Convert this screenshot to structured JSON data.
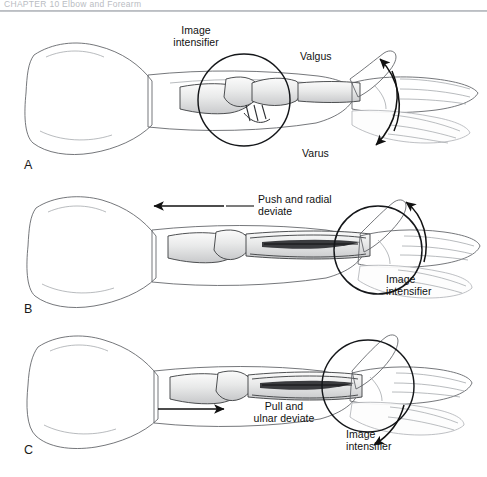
{
  "header": {
    "running_head": "CHAPTER 10   Elbow and Forearm"
  },
  "figure": {
    "background_color": "#ffffff",
    "ink_color": "#111111",
    "style": "grayscale medical pencil illustration"
  },
  "panels": [
    {
      "letter": "A",
      "description": "Elbow in extension with image intensifier positioned over the elbow joint; valgus and varus stress applied through the hand",
      "labels": {
        "intensifier": "Image\nintensifier",
        "valgus": "Valgus",
        "varus": "Varus"
      },
      "annotations": [
        {
          "name": "image-intensifier-circle",
          "target": "elbow joint"
        },
        {
          "name": "valgus-arrow",
          "direction": "up-right curved"
        },
        {
          "name": "varus-arrow",
          "direction": "down-right curved"
        }
      ]
    },
    {
      "letter": "B",
      "description": "Forearm with intramedullary nail in place; surgeon pushes and radially deviates the wrist while the image intensifier views the distal forearm",
      "labels": {
        "maneuver": "Push and radial\ndeviate",
        "intensifier": "Image\nintensifier"
      },
      "annotations": [
        {
          "name": "push-arrow",
          "direction": "left straight"
        },
        {
          "name": "radial-deviation-arrow",
          "direction": "up curved"
        },
        {
          "name": "image-intensifier-circle",
          "target": "wrist"
        }
      ]
    },
    {
      "letter": "C",
      "description": "Forearm with intramedullary nail in place; surgeon pulls and ulnar deviates the wrist while the image intensifier views the wrist",
      "labels": {
        "maneuver": "Pull and\nulnar deviate",
        "intensifier": "Image\nintensifier"
      },
      "annotations": [
        {
          "name": "pull-arrow",
          "direction": "right straight"
        },
        {
          "name": "ulnar-deviation-arrow",
          "direction": "down curved"
        },
        {
          "name": "image-intensifier-circle",
          "target": "wrist"
        }
      ]
    }
  ]
}
